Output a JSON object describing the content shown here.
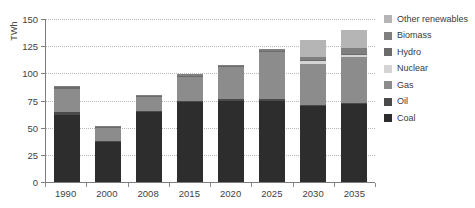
{
  "chart_data": {
    "type": "bar",
    "stacked": true,
    "title": "",
    "subtitle": "",
    "xlabel": "",
    "ylabel": "TWh",
    "ylim": [
      0,
      150
    ],
    "yticks": [
      0,
      25,
      50,
      75,
      100,
      125,
      150
    ],
    "grid": true,
    "legend_position": "right",
    "categories": [
      "1990",
      "2000",
      "2008",
      "2015",
      "2020",
      "2025",
      "2030",
      "2035"
    ],
    "series": [
      {
        "name": "Coal",
        "color": "#2d2d2d",
        "values": [
          62,
          37,
          64,
          74,
          75,
          75,
          70,
          72
        ]
      },
      {
        "name": "Oil",
        "color": "#4a4a4a",
        "values": [
          2,
          1,
          1,
          1,
          1,
          1,
          1,
          1
        ]
      },
      {
        "name": "Gas",
        "color": "#8c8c8c",
        "values": [
          22,
          12,
          13,
          22,
          30,
          44,
          38,
          42
        ]
      },
      {
        "name": "Nuclear",
        "color": "#d4d4d4",
        "values": [
          0,
          0,
          0,
          0,
          0,
          0,
          2,
          2
        ]
      },
      {
        "name": "Hydro",
        "color": "#6b6b6b",
        "values": [
          1,
          1,
          1,
          1,
          1,
          1,
          1,
          1
        ]
      },
      {
        "name": "Biomass",
        "color": "#7f7f7f",
        "values": [
          1,
          1,
          1,
          1,
          1,
          1,
          3,
          5
        ]
      },
      {
        "name": "Other renewables",
        "color": "#b5b5b5",
        "values": [
          0,
          0,
          0,
          0,
          0,
          0,
          16,
          17
        ]
      }
    ],
    "totals": [
      88,
      52,
      80,
      99,
      108,
      122,
      131,
      140
    ]
  },
  "legend": {
    "items": [
      {
        "label": "Other renewables",
        "color": "#b5b5b5"
      },
      {
        "label": "Biomass",
        "color": "#7f7f7f"
      },
      {
        "label": "Hydro",
        "color": "#6b6b6b"
      },
      {
        "label": "Nuclear",
        "color": "#d4d4d4"
      },
      {
        "label": "Gas",
        "color": "#8c8c8c"
      },
      {
        "label": "Oil",
        "color": "#4a4a4a"
      },
      {
        "label": "Coal",
        "color": "#2d2d2d"
      }
    ]
  },
  "axes": {
    "y_label": "TWh",
    "y_ticks": [
      "0",
      "25",
      "50",
      "75",
      "100",
      "125",
      "150"
    ],
    "x_ticks": [
      "1990",
      "2000",
      "2008",
      "2015",
      "2020",
      "2025",
      "2030",
      "2035"
    ]
  },
  "colors": {
    "grid": "#b9b9b9",
    "axis": "#7d7d7d",
    "text": "#3a3a3a",
    "background": "#ffffff"
  }
}
